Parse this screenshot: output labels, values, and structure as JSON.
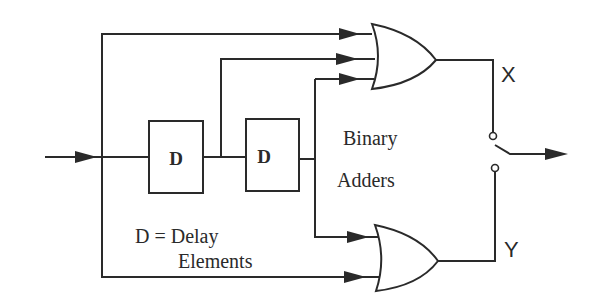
{
  "diagram": {
    "type": "block-diagram",
    "delay_elements": [
      {
        "label": "D"
      },
      {
        "label": "D"
      }
    ],
    "labels": {
      "adders_line1": "Binary",
      "adders_line2": "Adders",
      "legend_line1": "D = Delay",
      "legend_line2": "Elements",
      "output_x": "X",
      "output_y": "Y"
    },
    "gates": [
      {
        "name": "upper-adder",
        "inputs": 3,
        "output": "X"
      },
      {
        "name": "lower-adder",
        "inputs": 2,
        "output": "Y"
      }
    ],
    "switch": {
      "positions": [
        "X",
        "Y"
      ]
    },
    "colors": {
      "line": "#2a2a2a",
      "background": "#ffffff"
    }
  }
}
